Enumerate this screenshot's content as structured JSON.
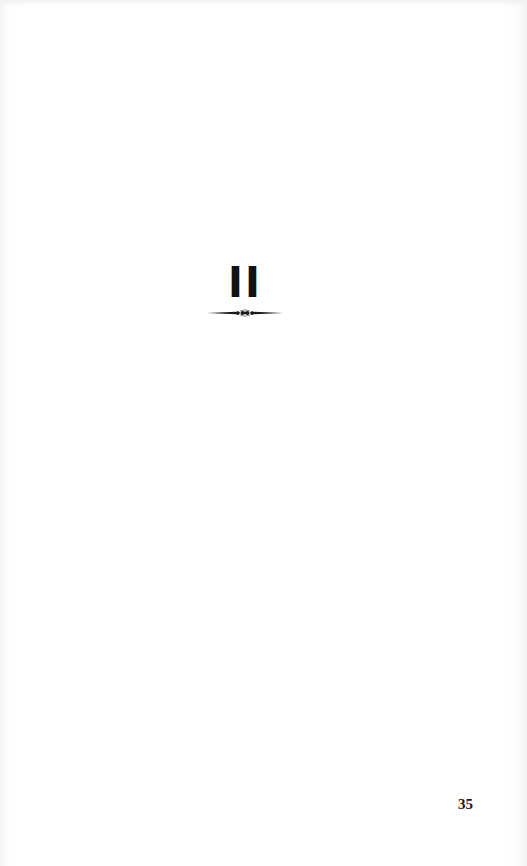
{
  "document": {
    "chapter": {
      "numeral": "II",
      "ornament": "decorative-rule-with-center-flourish"
    },
    "footer": {
      "page_number": "35"
    }
  },
  "colors": {
    "page_background": "#ffffff",
    "ink": "#111111"
  }
}
